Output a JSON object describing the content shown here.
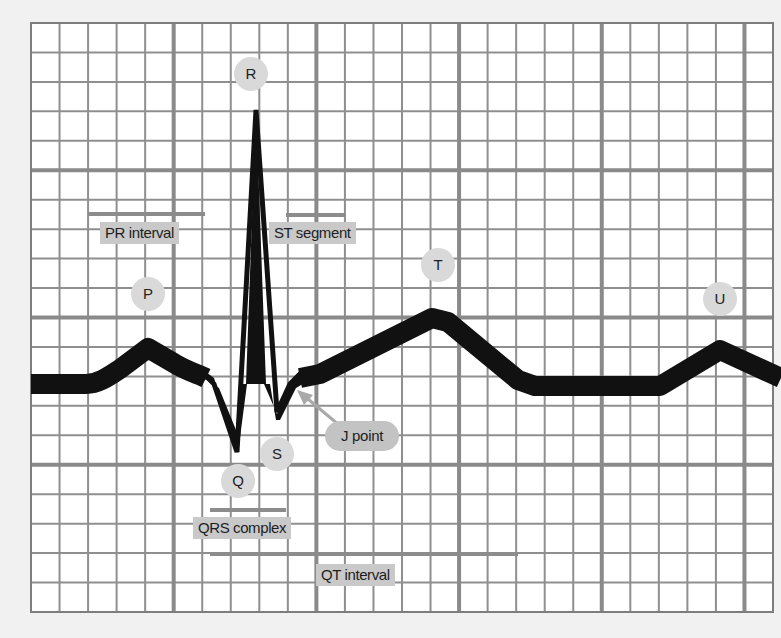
{
  "diagram": {
    "title_fragment": "",
    "grid": {
      "x0": 31,
      "y0": 23,
      "x1": 773,
      "y1": 612,
      "cols": 26,
      "rows": 20,
      "major_every": 5,
      "paper_color": "#ffffff",
      "minor_line_color": "#8f8f8f",
      "major_line_color": "#8a8a8a"
    },
    "waveform": {
      "color": "#111111",
      "description": "Single ECG cycle on grid paper: baseline, P wave, PR segment, QRS complex, ST segment, T wave, baseline, U wave"
    },
    "waves": [
      {
        "id": "P",
        "label": "P"
      },
      {
        "id": "Q",
        "label": "Q"
      },
      {
        "id": "R",
        "label": "R"
      },
      {
        "id": "S",
        "label": "S"
      },
      {
        "id": "T",
        "label": "T"
      },
      {
        "id": "U",
        "label": "U"
      }
    ],
    "intervals": [
      {
        "id": "pr_interval",
        "label": "PR interval"
      },
      {
        "id": "st_segment",
        "label": "ST segment"
      },
      {
        "id": "qrs_complex",
        "label": "QRS complex"
      },
      {
        "id": "qt_interval",
        "label": "QT interval"
      }
    ],
    "callouts": [
      {
        "id": "j_point",
        "label": "J point"
      }
    ],
    "colors": {
      "label_box": "#c9c9c9",
      "wave_circle": "#d9d9d9",
      "interval_bar": "#8c8c8c",
      "arrow": "#a9a9a9",
      "background": "#f1f1f1"
    }
  }
}
